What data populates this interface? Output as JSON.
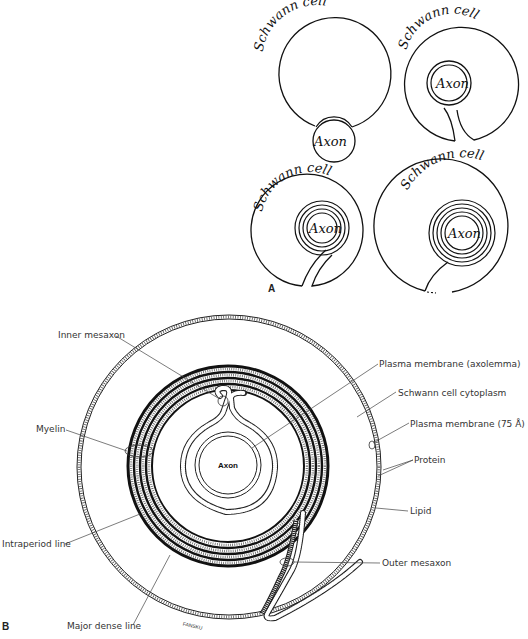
{
  "panel_a": {
    "letter": "A",
    "stages": [
      {
        "cell_label": "Schwann cell",
        "axon_label": "Axon"
      },
      {
        "cell_label": "Schwann cell",
        "axon_label": "Axon"
      },
      {
        "cell_label": "Schwann cell",
        "axon_label": "Axon"
      },
      {
        "cell_label": "Schwann cell",
        "axon_label": "Axon"
      }
    ]
  },
  "panel_b": {
    "letter": "B",
    "axon_label": "Axon",
    "artist_signature": "FANSKU",
    "labels": {
      "inner_mesaxon": "Inner mesaxon",
      "myelin": "Myelin",
      "intraperiod_line": "Intraperiod line",
      "major_dense_line": "Major dense line",
      "plasma_membrane_axolemma": "Plasma membrane (axolemma)",
      "schwann_cytoplasm": "Schwann cell cytoplasm",
      "plasma_membrane_75": "Plasma membrane (75 Å)",
      "protein": "Protein",
      "lipid": "Lipid",
      "outer_mesaxon": "Outer mesaxon"
    }
  }
}
